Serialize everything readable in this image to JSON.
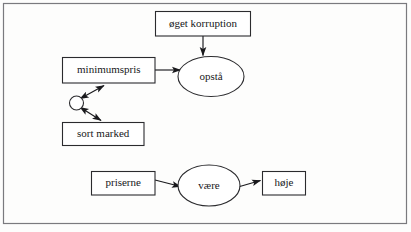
{
  "diagram": {
    "language": "da",
    "frame": {
      "present": true,
      "color": "#7a7a7e"
    },
    "colors": {
      "background": "#fdfdfc",
      "node_fill": "#ffffff",
      "node_stroke": "#2b2b2e",
      "edge": "#19191c",
      "text": "#17171a"
    },
    "nodes": [
      {
        "id": "oeget-korruption",
        "label": "øget korruption",
        "shape": "rectangle"
      },
      {
        "id": "minimumspris",
        "label": "minimumspris",
        "shape": "rectangle"
      },
      {
        "id": "opstaa",
        "label": "opstå",
        "shape": "ellipse"
      },
      {
        "id": "junction",
        "label": "",
        "shape": "circle"
      },
      {
        "id": "sort-marked",
        "label": "sort marked",
        "shape": "rectangle"
      },
      {
        "id": "priserne",
        "label": "priserne",
        "shape": "rectangle"
      },
      {
        "id": "vaere",
        "label": "være",
        "shape": "ellipse"
      },
      {
        "id": "hoeje",
        "label": "høje",
        "shape": "rectangle"
      }
    ],
    "edges": [
      {
        "from": "oeget-korruption",
        "to": "opstaa",
        "arrow": "single"
      },
      {
        "from": "minimumspris",
        "to": "opstaa",
        "arrow": "single"
      },
      {
        "from": "junction",
        "to": "minimumspris",
        "arrow": "double"
      },
      {
        "from": "junction",
        "to": "sort-marked",
        "arrow": "double"
      },
      {
        "from": "priserne",
        "to": "vaere",
        "arrow": "single"
      },
      {
        "from": "vaere",
        "to": "hoeje",
        "arrow": "single"
      }
    ]
  }
}
